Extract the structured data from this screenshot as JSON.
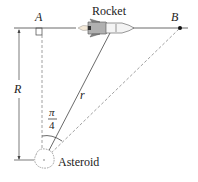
{
  "diagram": {
    "labels": {
      "point_a": "A",
      "point_b": "B",
      "rocket": "Rocket",
      "asteroid": "Asteroid",
      "distance_r_upper": "R",
      "distance_r_lower": "r",
      "angle_numerator": "π",
      "angle_denominator": "4"
    },
    "colors": {
      "line": "#333333",
      "dashed": "#888888",
      "rocket_body": "#f2f2f2",
      "rocket_fins": "#9a9a9a"
    }
  }
}
